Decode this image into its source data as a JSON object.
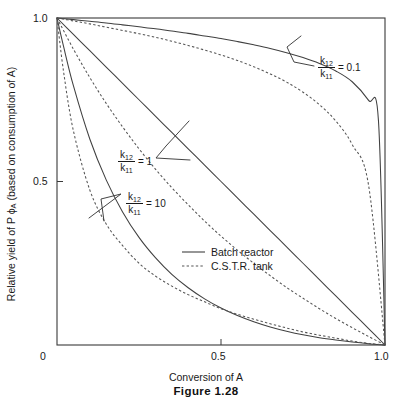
{
  "figure": {
    "caption": "Figure 1.28"
  },
  "axes": {
    "xlabel": "Conversion of A",
    "ylabel_prefix": "Relative yield of P ",
    "ylabel_symbol": "ϕ",
    "ylabel_symbol_sub": "A",
    "ylabel_suffix": " (based on consumption of A)",
    "ylabel_full": "Relative yield of P ϕA (based on consumption of A)",
    "x_ticks": [
      "0",
      "0.5",
      "1.0"
    ],
    "y_ticks": [
      "0.5",
      "1.0"
    ]
  },
  "legend": {
    "items": [
      {
        "label": "Batch reactor",
        "style": "solid"
      },
      {
        "label": "C.S.T.R. tank",
        "style": "dashed"
      }
    ]
  },
  "annotations": [
    {
      "id": "ratio-0p1",
      "numerator": "k",
      "numerator_sub": "12",
      "denominator": "k",
      "denominator_sub": "11",
      "equals": "= 0.1"
    },
    {
      "id": "ratio-1",
      "numerator": "k",
      "numerator_sub": "12",
      "denominator": "k",
      "denominator_sub": "11",
      "equals": "= 1"
    },
    {
      "id": "ratio-10",
      "numerator": "k",
      "numerator_sub": "12",
      "denominator": "k",
      "denominator_sub": "11",
      "equals": "= 10"
    }
  ],
  "chart_data": {
    "type": "line",
    "title": "Figure 1.28",
    "xlabel": "Conversion of A",
    "ylabel": "Relative yield of P ϕA (based on consumption of A)",
    "xlim": [
      0,
      1
    ],
    "ylim": [
      0,
      1
    ],
    "grid": false,
    "legend_position": "center",
    "x_tick_values": [
      0,
      0.5,
      1.0
    ],
    "y_tick_values": [
      0.5,
      1.0
    ],
    "parameter_name": "k12/k11",
    "parameter_values": [
      0.1,
      1,
      10
    ],
    "series": [
      {
        "name": "Batch reactor, k12/k11 = 0.1",
        "style": "solid",
        "reactor": "batch",
        "ratio": 0.1,
        "x": [
          0,
          0.05,
          0.1,
          0.15,
          0.2,
          0.25,
          0.3,
          0.35,
          0.4,
          0.45,
          0.5,
          0.55,
          0.6,
          0.65,
          0.7,
          0.75,
          0.8,
          0.85,
          0.9,
          0.95,
          0.98,
          1.0
        ],
        "y": [
          1.0,
          0.995,
          0.99,
          0.985,
          0.979,
          0.973,
          0.967,
          0.96,
          0.953,
          0.945,
          0.937,
          0.928,
          0.918,
          0.907,
          0.894,
          0.879,
          0.861,
          0.838,
          0.805,
          0.748,
          0.687,
          0.0
        ]
      },
      {
        "name": "C.S.T.R. tank, k12/k11 = 0.1",
        "style": "dashed",
        "reactor": "cstr",
        "ratio": 0.1,
        "x": [
          0,
          0.05,
          0.1,
          0.15,
          0.2,
          0.25,
          0.3,
          0.35,
          0.4,
          0.45,
          0.5,
          0.55,
          0.6,
          0.65,
          0.7,
          0.75,
          0.8,
          0.85,
          0.9,
          0.95,
          1.0
        ],
        "y": [
          1.0,
          0.991,
          0.982,
          0.972,
          0.962,
          0.952,
          0.941,
          0.929,
          0.916,
          0.902,
          0.887,
          0.87,
          0.851,
          0.829,
          0.804,
          0.773,
          0.735,
          0.685,
          0.613,
          0.488,
          0.0
        ]
      },
      {
        "name": "Batch reactor, k12/k11 = 1",
        "style": "solid",
        "reactor": "batch",
        "ratio": 1,
        "x": [
          0,
          0.05,
          0.1,
          0.15,
          0.2,
          0.25,
          0.3,
          0.35,
          0.4,
          0.45,
          0.5,
          0.55,
          0.6,
          0.65,
          0.7,
          0.75,
          0.8,
          0.85,
          0.9,
          0.95,
          1.0
        ],
        "y": [
          1.0,
          0.95,
          0.9,
          0.85,
          0.8,
          0.75,
          0.7,
          0.65,
          0.6,
          0.55,
          0.5,
          0.45,
          0.4,
          0.35,
          0.3,
          0.25,
          0.2,
          0.15,
          0.1,
          0.05,
          0.0
        ]
      },
      {
        "name": "C.S.T.R. tank, k12/k11 = 1",
        "style": "dashed",
        "reactor": "cstr",
        "ratio": 1,
        "x": [
          0,
          0.05,
          0.1,
          0.15,
          0.2,
          0.25,
          0.3,
          0.35,
          0.4,
          0.45,
          0.5,
          0.55,
          0.6,
          0.65,
          0.7,
          0.75,
          0.8,
          0.85,
          0.9,
          0.95,
          1.0
        ],
        "y": [
          1.0,
          0.905,
          0.818,
          0.739,
          0.667,
          0.6,
          0.538,
          0.481,
          0.429,
          0.379,
          0.333,
          0.29,
          0.25,
          0.212,
          0.176,
          0.143,
          0.111,
          0.081,
          0.053,
          0.026,
          0.0
        ]
      },
      {
        "name": "Batch reactor, k12/k11 = 10",
        "style": "solid",
        "reactor": "batch",
        "ratio": 10,
        "x": [
          0,
          0.02,
          0.05,
          0.1,
          0.15,
          0.2,
          0.25,
          0.3,
          0.35,
          0.4,
          0.45,
          0.5,
          0.55,
          0.6,
          0.65,
          0.7,
          0.75,
          0.8,
          0.85,
          0.9,
          0.95,
          1.0
        ],
        "y": [
          1.0,
          0.913,
          0.793,
          0.63,
          0.505,
          0.407,
          0.329,
          0.267,
          0.216,
          0.175,
          0.141,
          0.113,
          0.09,
          0.071,
          0.055,
          0.042,
          0.031,
          0.022,
          0.015,
          0.009,
          0.004,
          0.0
        ]
      },
      {
        "name": "C.S.T.R. tank, k12/k11 = 10",
        "style": "dashed",
        "reactor": "cstr",
        "ratio": 10,
        "x": [
          0,
          0.02,
          0.05,
          0.1,
          0.15,
          0.2,
          0.25,
          0.3,
          0.35,
          0.4,
          0.45,
          0.5,
          0.55,
          0.6,
          0.65,
          0.7,
          0.75,
          0.8,
          0.85,
          0.9,
          0.95,
          1.0
        ],
        "y": [
          1.0,
          0.836,
          0.655,
          0.474,
          0.37,
          0.304,
          0.25,
          0.211,
          0.18,
          0.154,
          0.132,
          0.111,
          0.094,
          0.079,
          0.065,
          0.052,
          0.04,
          0.03,
          0.021,
          0.012,
          0.005,
          0.0
        ]
      }
    ]
  }
}
